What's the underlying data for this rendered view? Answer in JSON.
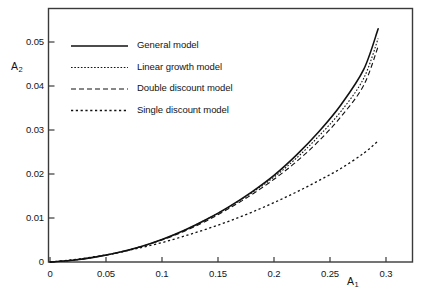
{
  "chart_data": {
    "type": "line",
    "title": "",
    "xlabel": "A_1",
    "ylabel": "A_2",
    "xlabel_display": "A",
    "xlabel_sub": "1",
    "ylabel_display": "A",
    "ylabel_sub": "2",
    "xlim": [
      0,
      0.32
    ],
    "ylim": [
      0,
      0.0575
    ],
    "xticks": [
      0,
      0.05,
      0.1,
      0.15,
      0.2,
      0.25,
      0.3
    ],
    "xtick_labels": [
      "0",
      "0.05",
      "0.1",
      "0.15",
      "0.2",
      "0.25",
      "0.3"
    ],
    "yticks": [
      0,
      0.01,
      0.02,
      0.03,
      0.04,
      0.05
    ],
    "ytick_labels": [
      "0",
      "0.01",
      "0.02",
      "0.03",
      "0.04",
      "0.05"
    ],
    "grid": false,
    "legend_position": "upper-left",
    "frame": "box",
    "series": [
      {
        "name": "General model",
        "linestyle": "solid",
        "color": "#111111",
        "linewidth": 1.6,
        "x": [
          0,
          0.02,
          0.04,
          0.06,
          0.08,
          0.1,
          0.12,
          0.14,
          0.16,
          0.18,
          0.2,
          0.22,
          0.24,
          0.26,
          0.28,
          0.293
        ],
        "y": [
          0,
          0.0004,
          0.0011,
          0.0021,
          0.0034,
          0.0051,
          0.0072,
          0.0097,
          0.0126,
          0.0159,
          0.0197,
          0.0243,
          0.0296,
          0.0358,
          0.0437,
          0.053
        ]
      },
      {
        "name": "Linear growth model",
        "linestyle": "fine-dotted",
        "color": "#111111",
        "linewidth": 1.1,
        "x": [
          0,
          0.02,
          0.04,
          0.06,
          0.08,
          0.1,
          0.12,
          0.14,
          0.16,
          0.18,
          0.2,
          0.22,
          0.24,
          0.26,
          0.28,
          0.293
        ],
        "y": [
          0,
          0.0004,
          0.0011,
          0.0021,
          0.0034,
          0.0051,
          0.0072,
          0.0097,
          0.0125,
          0.0157,
          0.0193,
          0.0236,
          0.0286,
          0.0343,
          0.0417,
          0.0508
        ]
      },
      {
        "name": "Double discount model",
        "linestyle": "dashed",
        "color": "#111111",
        "linewidth": 1.1,
        "x": [
          0,
          0.02,
          0.04,
          0.06,
          0.08,
          0.1,
          0.12,
          0.14,
          0.16,
          0.18,
          0.2,
          0.22,
          0.24,
          0.26,
          0.28,
          0.293
        ],
        "y": [
          0,
          0.0004,
          0.0011,
          0.0021,
          0.0034,
          0.005,
          0.007,
          0.0094,
          0.0122,
          0.0153,
          0.0188,
          0.0228,
          0.0275,
          0.0331,
          0.0401,
          0.049
        ]
      },
      {
        "name": "Single discount model",
        "linestyle": "dotted",
        "color": "#111111",
        "linewidth": 1.3,
        "x": [
          0,
          0.02,
          0.04,
          0.06,
          0.08,
          0.1,
          0.12,
          0.14,
          0.16,
          0.18,
          0.2,
          0.22,
          0.24,
          0.26,
          0.28,
          0.293
        ],
        "y": [
          0,
          0.0005,
          0.0012,
          0.0021,
          0.0032,
          0.0044,
          0.0059,
          0.0075,
          0.0093,
          0.0113,
          0.0135,
          0.0159,
          0.0185,
          0.0213,
          0.0247,
          0.0275
        ]
      }
    ]
  }
}
